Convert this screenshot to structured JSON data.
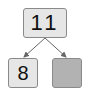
{
  "diagram": {
    "type": "number-bond",
    "whole": {
      "value": "11",
      "fill": "#e6e6e6"
    },
    "parts": [
      {
        "value": "8",
        "fill": "#e6e6e6"
      },
      {
        "value": "",
        "fill": "#b2b2b2"
      }
    ],
    "arrow_color": "#666666"
  }
}
